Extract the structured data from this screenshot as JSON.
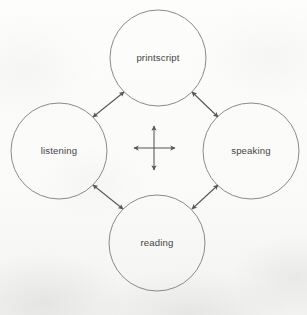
{
  "figure": {
    "name": "four-skills-interaction-diagram",
    "background_color": "#fbfbfa",
    "stroke_color": "#8a8a8a",
    "arrow_color": "#555555",
    "label_color": "#454545",
    "width": 307,
    "height": 315
  },
  "nodes": [
    {
      "id": "printscript",
      "label": "printscript",
      "cx": 158,
      "cy": 58,
      "r": 48,
      "position": "top"
    },
    {
      "id": "listening",
      "label": "listening",
      "cx": 59,
      "cy": 151,
      "r": 48,
      "position": "left"
    },
    {
      "id": "speaking",
      "label": "speaking",
      "cx": 251,
      "cy": 151,
      "r": 48,
      "position": "right"
    },
    {
      "id": "reading",
      "label": "reading",
      "cx": 157,
      "cy": 243,
      "r": 48,
      "position": "bottom"
    }
  ],
  "connectors": [
    {
      "id": "listening-printscript",
      "from": "listening",
      "to": "printscript",
      "style": "double-headed-arrow"
    },
    {
      "id": "printscript-speaking",
      "from": "printscript",
      "to": "speaking",
      "style": "double-headed-arrow"
    },
    {
      "id": "listening-reading",
      "from": "listening",
      "to": "reading",
      "style": "double-headed-arrow"
    },
    {
      "id": "reading-speaking",
      "from": "reading",
      "to": "speaking",
      "style": "double-headed-arrow"
    }
  ],
  "center_cross": {
    "id": "center-cross-arrows",
    "style": "four-way-double-headed-arrow",
    "cx": 154,
    "cy": 148,
    "half_width": 20,
    "half_height": 22
  }
}
